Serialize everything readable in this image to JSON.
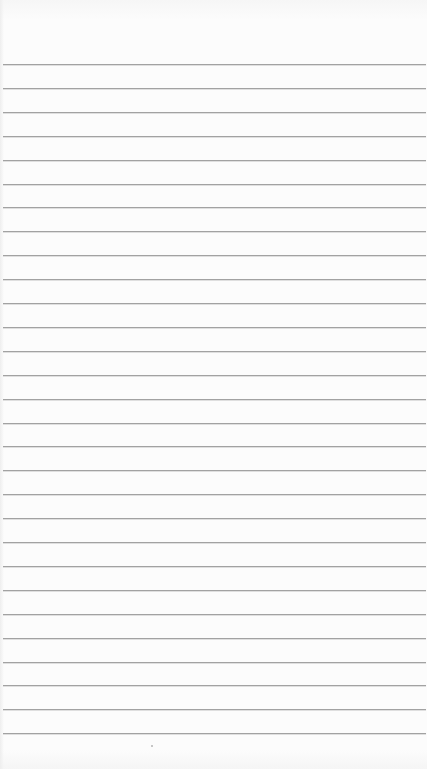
{
  "page": {
    "type": "lined-paper",
    "background_color": "#fcfcfc",
    "line_color": "#a2a2a2",
    "line_count": 29,
    "first_line_y": 64,
    "line_spacing_px": 23.9,
    "lines_text": []
  },
  "marks": [
    {
      "x": 151,
      "y": 745
    }
  ]
}
